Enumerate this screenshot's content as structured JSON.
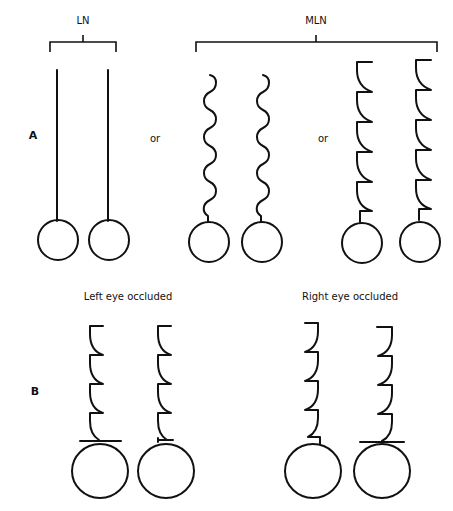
{
  "figure": {
    "panel_a": {
      "letter": "A",
      "or_1": "or",
      "or_2": "or",
      "groups": [
        {
          "label": "LN",
          "waveform": "straight-line"
        },
        {
          "label": "MLN",
          "waveforms": [
            "pendular-sinusoid",
            "jerk-sawtooth"
          ]
        }
      ]
    },
    "panel_b": {
      "letter": "B",
      "left_caption": "Left eye occluded",
      "right_caption": "Right eye occluded"
    },
    "colors": {
      "ink": "#111111",
      "background": "#ffffff"
    }
  }
}
